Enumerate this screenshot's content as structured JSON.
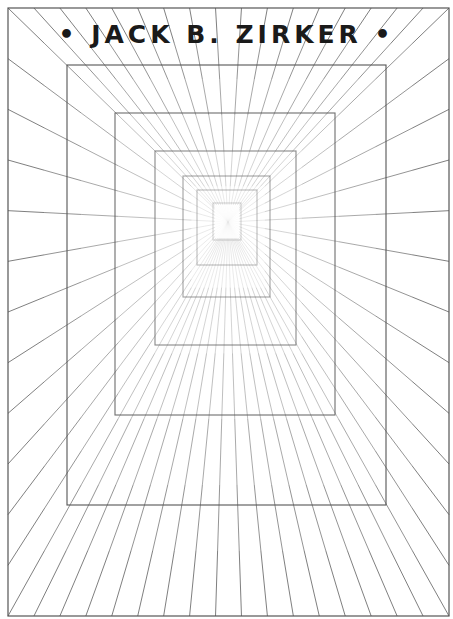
{
  "title": {
    "text": "• JACK B. ZIRKER •"
  },
  "artwork": {
    "vanishing_point": [
      228,
      222
    ],
    "stroke_color": "#555555",
    "frame": [
      8,
      8,
      449,
      616
    ],
    "rectangles": [
      [
        67,
        65,
        386,
        505
      ],
      [
        115,
        113,
        335,
        415
      ],
      [
        155,
        151,
        296,
        345
      ],
      [
        183,
        176,
        270,
        297
      ],
      [
        197,
        190,
        257,
        265
      ],
      [
        213,
        203,
        241,
        240
      ]
    ],
    "rays_per_side": {
      "top": 17,
      "bottom": 17,
      "left": 12,
      "right": 12
    }
  }
}
